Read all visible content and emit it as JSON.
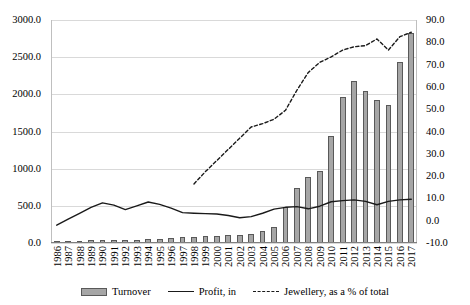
{
  "chart_data": {
    "type": "bar",
    "title": "",
    "subtitle": "",
    "xlabel": "",
    "ylabel": "",
    "y2label": "",
    "grid": true,
    "legend_position": "bottom",
    "categories": [
      "1986",
      "1987",
      "1988",
      "1989",
      "1990",
      "1991",
      "1992",
      "1993",
      "1994",
      "1995",
      "1996",
      "1997",
      "1998",
      "1999",
      "2000",
      "2001",
      "2002",
      "2003",
      "2004",
      "2005",
      "2006",
      "2007",
      "2008",
      "2009",
      "2010",
      "2011",
      "2012",
      "2013",
      "2014",
      "2015",
      "2016",
      "2017"
    ],
    "ylim": [
      0.0,
      3000.0
    ],
    "yticks": [
      0.0,
      500.0,
      1000.0,
      1500.0,
      2000.0,
      2500.0,
      3000.0
    ],
    "ytick_labels": [
      "0.0",
      "500.0",
      "1000.0",
      "1500.0",
      "2000.0",
      "2500.0",
      "3000.0"
    ],
    "y2lim": [
      -10.0,
      90.0
    ],
    "y2ticks": [
      -10.0,
      0.0,
      10.0,
      20.0,
      30.0,
      40.0,
      50.0,
      60.0,
      70.0,
      80.0,
      90.0
    ],
    "y2tick_labels": [
      "-10.0",
      "0.0",
      "10.0",
      "20.0",
      "30.0",
      "40.0",
      "50.0",
      "60.0",
      "70.0",
      "80.0",
      "90.0"
    ],
    "series": [
      {
        "name": "Turnover",
        "type": "bar",
        "axis": "left",
        "color": "#a6a6a6",
        "edge_color": "#595959",
        "values": [
          5,
          12,
          20,
          40,
          42,
          44,
          44,
          46,
          50,
          60,
          70,
          80,
          78,
          100,
          100,
          102,
          105,
          125,
          158,
          215,
          485,
          740,
          890,
          975,
          1440,
          1965,
          2185,
          2050,
          1930,
          1850,
          2435,
          2825
        ]
      },
      {
        "name": "Profit, in",
        "type": "line",
        "axis": "left",
        "color": "#1a1a1a",
        "dash": "solid",
        "values": [
          240,
          320,
          400,
          480,
          540,
          510,
          450,
          500,
          552,
          520,
          470,
          408,
          400,
          395,
          390,
          370,
          340,
          355,
          400,
          455,
          480,
          490,
          460,
          495,
          555,
          570,
          580,
          560,
          515,
          560,
          580,
          588
        ]
      },
      {
        "name": "Jewellery, as a % of total",
        "type": "line",
        "axis": "right",
        "color": "#1a1a1a",
        "dash": "dashed",
        "values": [
          null,
          null,
          null,
          null,
          null,
          null,
          null,
          null,
          null,
          null,
          null,
          null,
          16.5,
          22.0,
          27.0,
          32.0,
          37.0,
          42.0,
          43.5,
          45.5,
          49.5,
          58.5,
          66.5,
          71.0,
          73.5,
          76.5,
          78.0,
          78.5,
          81.5,
          76.5,
          82.5,
          84.5
        ]
      }
    ]
  },
  "legend": {
    "items": [
      {
        "label": "Turnover",
        "marker": "bar-swatch"
      },
      {
        "label": "Profit, in",
        "marker": "solid-line"
      },
      {
        "label": "Jewellery, as a % of total",
        "marker": "dashed-line"
      }
    ]
  }
}
